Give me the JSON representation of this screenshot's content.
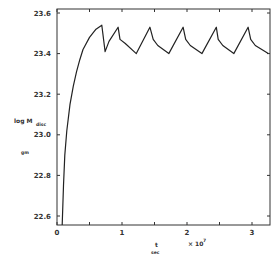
{
  "chart_data": {
    "type": "line",
    "title": "",
    "xlabel": "t (sec)",
    "xlabel_main": "t",
    "xlabel_unit": "sec",
    "x_multiplier": "× 10",
    "x_multiplier_exp": "7",
    "ylabel": "log M_disc (gm)",
    "ylabel_main": "log M",
    "ylabel_sub": "disc",
    "ylabel_unit": "gm",
    "xlim": [
      0,
      3.25
    ],
    "ylim": [
      22.55,
      23.62
    ],
    "x_ticks": [
      "0",
      "1",
      "2",
      "3"
    ],
    "y_ticks": [
      "23.6",
      "23.4",
      "23.2",
      "23.0",
      "22.8",
      "22.6"
    ],
    "grid": false,
    "series": [
      {
        "name": "log M_disc",
        "x": [
          0.08,
          0.1,
          0.12,
          0.15,
          0.2,
          0.25,
          0.3,
          0.35,
          0.4,
          0.5,
          0.6,
          0.69,
          0.74,
          0.8,
          0.94,
          0.97,
          1.05,
          1.22,
          1.43,
          1.48,
          1.55,
          1.72,
          1.94,
          1.98,
          2.05,
          2.23,
          2.45,
          2.48,
          2.55,
          2.72,
          2.94,
          2.98,
          3.05,
          3.25
        ],
        "y": [
          22.55,
          22.75,
          22.9,
          23.02,
          23.15,
          23.24,
          23.31,
          23.37,
          23.42,
          23.48,
          23.52,
          23.54,
          23.41,
          23.46,
          23.53,
          23.47,
          23.45,
          23.4,
          23.53,
          23.47,
          23.44,
          23.4,
          23.53,
          23.47,
          23.44,
          23.4,
          23.53,
          23.47,
          23.44,
          23.4,
          23.53,
          23.47,
          23.44,
          23.4
        ]
      }
    ]
  }
}
